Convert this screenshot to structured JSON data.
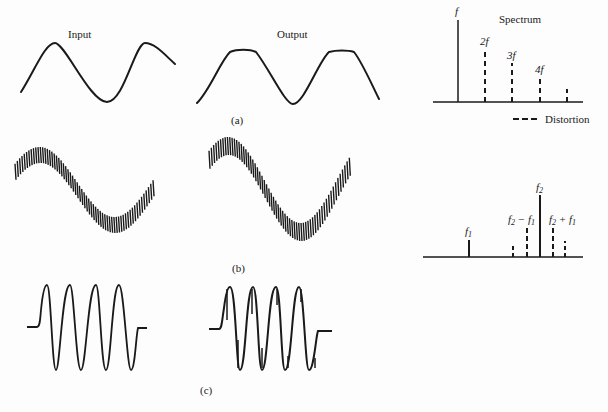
{
  "figure": {
    "panel_a": {
      "input_label": "Input",
      "output_label": "Output",
      "caption": "(a)",
      "spectrum_title": "Spectrum",
      "legend_label": "Distortion",
      "harmonic_labels": [
        "f",
        "2f",
        "3f",
        "4f"
      ]
    },
    "panel_b": {
      "caption": "(b)",
      "labels": {
        "f1": "f",
        "f1_sub": "1",
        "f2": "f",
        "f2_sub": "2",
        "diff": "f",
        "diff_sub_a": "2",
        "diff_mid": " − f",
        "diff_sub_b": "1",
        "sum": "f",
        "sum_sub_a": "2",
        "sum_mid": " + f",
        "sum_sub_b": "1"
      }
    },
    "panel_c": {
      "caption": "(c)"
    }
  },
  "chart_data": [
    {
      "type": "bar",
      "title": "Spectrum",
      "panel": "(a)",
      "categories": [
        "f",
        "2f",
        "3f",
        "4f",
        "5f"
      ],
      "series": [
        {
          "name": "Fundamental",
          "style": "solid",
          "values": [
            82,
            0,
            0,
            0,
            0
          ]
        },
        {
          "name": "Distortion",
          "style": "dashed",
          "values": [
            0,
            52,
            39,
            25,
            13
          ]
        }
      ],
      "legend": [
        "Distortion"
      ]
    },
    {
      "type": "bar",
      "panel": "(b)",
      "categories": [
        "f1",
        "f2-2f1",
        "f2-f1",
        "f2",
        "f2+f1",
        "f2+2f1"
      ],
      "series": [
        {
          "name": "Signal",
          "style": "solid",
          "values": [
            17,
            0,
            0,
            62,
            0,
            0
          ]
        },
        {
          "name": "Distortion",
          "style": "dashed",
          "values": [
            0,
            14,
            30,
            0,
            30,
            16
          ]
        }
      ]
    }
  ]
}
